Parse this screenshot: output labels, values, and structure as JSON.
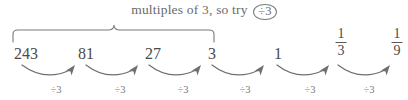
{
  "diagram": {
    "caption": {
      "text": "multiples of 3, so try",
      "circled_operation": "÷3"
    },
    "sequence": [
      {
        "label": "243",
        "kind": "whole",
        "x": 26
      },
      {
        "label": "81",
        "kind": "whole",
        "x": 86
      },
      {
        "label": "27",
        "kind": "whole",
        "x": 153
      },
      {
        "label": "3",
        "kind": "whole",
        "x": 212
      },
      {
        "label": "1",
        "kind": "whole",
        "x": 278
      },
      {
        "numerator": "1",
        "denominator": "3",
        "kind": "fraction",
        "x": 341
      },
      {
        "numerator": "1",
        "denominator": "9",
        "kind": "fraction",
        "x": 397
      }
    ],
    "operations": [
      {
        "label": "÷3",
        "x": 56
      },
      {
        "label": "÷3",
        "x": 120
      },
      {
        "label": "÷3",
        "x": 183
      },
      {
        "label": "÷3",
        "x": 245
      },
      {
        "label": "÷3",
        "x": 310
      },
      {
        "label": "÷3",
        "x": 369
      }
    ],
    "colors": {
      "ink": "#5a5a5a",
      "term_ink": "#4a4a4a",
      "rule": "#7a7a7a",
      "background": "#ffffff"
    }
  }
}
